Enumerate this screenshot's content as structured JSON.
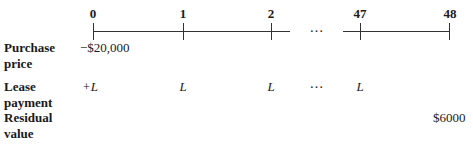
{
  "timeline": {
    "periods": [
      "0",
      "1",
      "2",
      "47",
      "48"
    ],
    "ellipsis": "…",
    "line_color": "#333333"
  },
  "rows": [
    {
      "label_line1": "Purchase",
      "label_line2": "price",
      "cells": {
        "0": "−$20,000"
      }
    },
    {
      "label_line1": "Lease",
      "label_line2": "payment",
      "cells": {
        "0": "+L",
        "1": "L",
        "2": "L",
        "ellipsis": "…",
        "47": "L"
      }
    },
    {
      "label_line1": "Residual",
      "label_line2": "value",
      "cells": {
        "48": "$6000"
      }
    }
  ]
}
